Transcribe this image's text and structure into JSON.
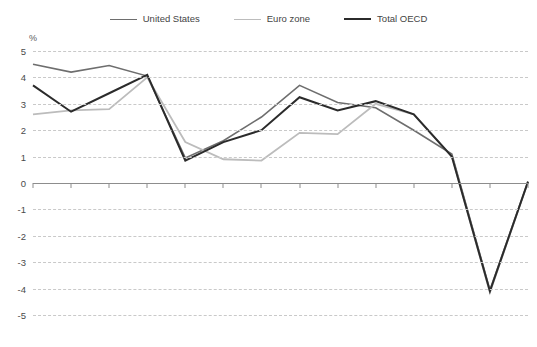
{
  "chart_data": {
    "type": "line",
    "title": "",
    "xlabel": "",
    "ylabel": "%",
    "ylim": [
      -5,
      5
    ],
    "ytick_values": [
      5,
      4,
      3,
      2,
      1,
      0,
      -1,
      -2,
      -3,
      -4,
      -5
    ],
    "ytick_labels": [
      "5",
      "4",
      "3",
      "2",
      "1",
      "0",
      "-1",
      "-2",
      "-3",
      "-4",
      "-5"
    ],
    "grid": true,
    "legend_position": "top-center",
    "categories": [
      "1997",
      "1998",
      "1999",
      "2000",
      "2001",
      "2002",
      "2003",
      "2004",
      "2005",
      "2006",
      "2007",
      "2008(e)",
      "2009(p)",
      "2010(p)"
    ],
    "series": [
      {
        "name": "United States",
        "color": "#6e6e6e",
        "width": 1.6,
        "values": [
          4.5,
          4.2,
          4.45,
          4.05,
          0.95,
          1.6,
          2.5,
          3.7,
          3.05,
          2.85,
          2.0,
          1.1,
          -4.05,
          0.05
        ]
      },
      {
        "name": "Euro zone",
        "color": "#bcbcbc",
        "width": 1.8,
        "values": [
          2.6,
          2.75,
          2.8,
          4.0,
          1.55,
          0.9,
          0.85,
          1.9,
          1.85,
          3.0,
          2.6,
          1.0,
          -4.15,
          0.05
        ]
      },
      {
        "name": "Total OECD",
        "color": "#2b2b2b",
        "width": 2.0,
        "values": [
          3.7,
          2.7,
          3.4,
          4.1,
          0.85,
          1.55,
          2.0,
          3.25,
          2.75,
          3.1,
          2.6,
          1.0,
          -4.1,
          0.05
        ]
      }
    ]
  },
  "legend": {
    "items": [
      {
        "label": "United States"
      },
      {
        "label": "Euro zone"
      },
      {
        "label": "Total OECD"
      }
    ]
  }
}
